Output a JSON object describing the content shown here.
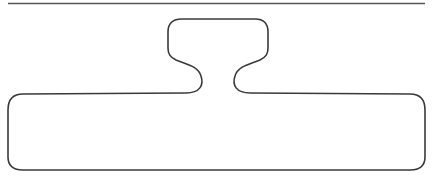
{
  "diagram": {
    "type": "outline-shape",
    "stroke_color": "#3a3a3a",
    "rule_color": "#555555",
    "background": "#ffffff",
    "stroke_width": 1.6
  }
}
